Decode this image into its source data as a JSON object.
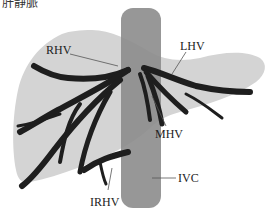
{
  "title": "肝静脈",
  "labels": {
    "rhv": "RHV",
    "lhv": "LHV",
    "mhv": "MHV",
    "ivc": "IVC",
    "irhv": "IRHV"
  },
  "colors": {
    "liver": "#d4d4d4",
    "ivc": "#8c8c8c",
    "vein": "#1e1e1e",
    "leader": "#555555"
  }
}
